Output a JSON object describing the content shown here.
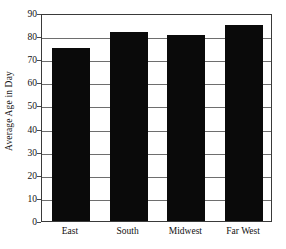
{
  "chart_data": {
    "type": "bar",
    "title": "",
    "subtitle": "",
    "xlabel": "",
    "ylabel": "Average Age in Day",
    "categories": [
      "East",
      "South",
      "Midwest",
      "Far West"
    ],
    "values": [
      75,
      82,
      80.5,
      85
    ],
    "series": [
      {
        "name": "Average Age in Day",
        "values": [
          75,
          82,
          80.5,
          85
        ],
        "color": "#0a0a0a"
      }
    ],
    "ylim": [
      0,
      90
    ],
    "ytick_step": 10,
    "yticks": [
      0,
      10,
      20,
      30,
      40,
      50,
      60,
      70,
      80,
      90
    ],
    "ytick_labels": [
      "0",
      "10",
      "20",
      "30",
      "40",
      "50",
      "60",
      "70",
      "80",
      "90"
    ],
    "grid": true,
    "grid_axis": "y",
    "legend": false,
    "legend_position": "none",
    "bar_color": "#0a0a0a",
    "plot_border_color": "#3a3a3a",
    "gridline_color": "#6e6e6e",
    "background_color": "#ffffff",
    "annotations": []
  }
}
